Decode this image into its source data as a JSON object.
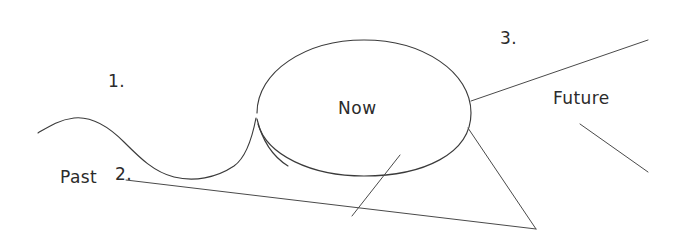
{
  "diagram": {
    "kind": "hand-drawn-timeline-sketch",
    "background_color": "#ffffff",
    "ink_color": "#3b3b3b",
    "width": 680,
    "height": 246,
    "labels": {
      "past": "Past",
      "now": "Now",
      "future": "Future",
      "marker_one": "1.",
      "marker_two": "2.",
      "marker_three": "3."
    },
    "shapes": {
      "ellipse_label": "Now",
      "wave_label": "Past",
      "fan_label": "Future"
    }
  }
}
